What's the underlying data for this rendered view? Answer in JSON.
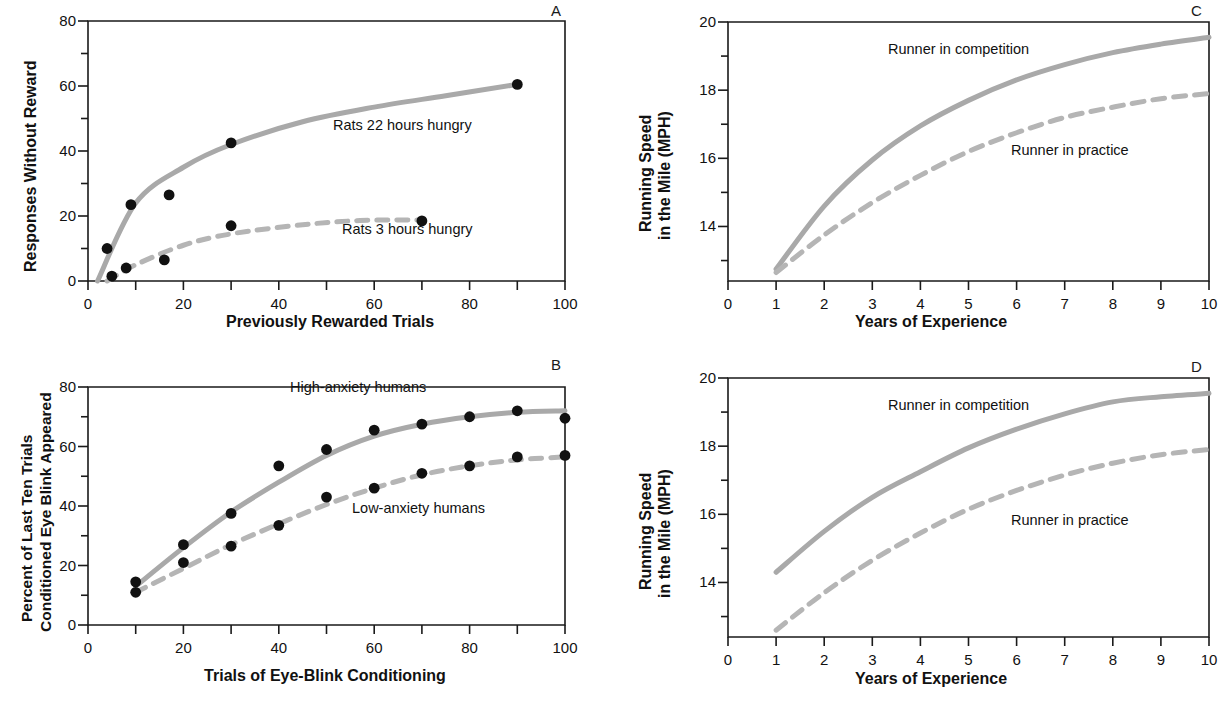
{
  "figure": {
    "panels": [
      "A",
      "B",
      "C",
      "D"
    ],
    "curve_color": "#a9a9a9",
    "point_color": "#111111",
    "axis_color": "#1a1a1a"
  },
  "panelA": {
    "letter": "A",
    "xlabel": "Previously Rewarded Trials",
    "ylabel": "Responses Without Reward",
    "xticks": [
      "0",
      "20",
      "40",
      "60",
      "80",
      "100"
    ],
    "yticks": [
      "0",
      "20",
      "40",
      "60",
      "80"
    ],
    "label_solid": "Rats 22 hours hungry",
    "label_dashed": "Rats 3 hours hungry"
  },
  "panelB": {
    "letter": "B",
    "xlabel": "Trials of Eye-Blink Conditioning",
    "ylabel_line1": "Percent of Last Ten Trials",
    "ylabel_line2": "Conditioned Eye Blink Appeared",
    "xticks": [
      "0",
      "20",
      "40",
      "60",
      "80",
      "100"
    ],
    "yticks": [
      "0",
      "20",
      "40",
      "60",
      "80"
    ],
    "label_solid": "High-anxiety humans",
    "label_dashed": "Low-anxiety humans"
  },
  "panelC": {
    "letter": "C",
    "xlabel": "Years of Experience",
    "ylabel_line1": "Running Speed",
    "ylabel_line2": "in the Mile (MPH)",
    "xticks": [
      "0",
      "1",
      "2",
      "3",
      "4",
      "5",
      "6",
      "7",
      "8",
      "9",
      "10"
    ],
    "yticks": [
      "14",
      "16",
      "18",
      "20"
    ],
    "label_solid": "Runner in competition",
    "label_dashed": "Runner in practice"
  },
  "panelD": {
    "letter": "D",
    "xlabel": "Years of Experience",
    "ylabel_line1": "Running Speed",
    "ylabel_line2": "in the Mile (MPH)",
    "xticks": [
      "0",
      "1",
      "2",
      "3",
      "4",
      "5",
      "6",
      "7",
      "8",
      "9",
      "10"
    ],
    "yticks": [
      "14",
      "16",
      "18",
      "20"
    ],
    "label_solid": "Runner in competition",
    "label_dashed": "Runner in practice"
  },
  "chart_data": [
    {
      "panel": "A",
      "type": "scatter",
      "title": "",
      "xlabel": "Previously Rewarded Trials",
      "ylabel": "Responses Without Reward",
      "xlim": [
        0,
        100
      ],
      "ylim": [
        0,
        80
      ],
      "grid": false,
      "legend": "inline-annotation",
      "series": [
        {
          "name": "Rats 22 hours hungry",
          "style": "solid",
          "color": "#a9a9a9",
          "points": [
            {
              "x": 4,
              "y": 10
            },
            {
              "x": 9,
              "y": 23.5
            },
            {
              "x": 17,
              "y": 26.5
            },
            {
              "x": 30,
              "y": 42.5
            },
            {
              "x": 90,
              "y": 60.5
            }
          ],
          "fit_curve": [
            {
              "x": 2,
              "y": 0
            },
            {
              "x": 10,
              "y": 24
            },
            {
              "x": 20,
              "y": 35
            },
            {
              "x": 30,
              "y": 42
            },
            {
              "x": 45,
              "y": 49
            },
            {
              "x": 60,
              "y": 53.5
            },
            {
              "x": 75,
              "y": 57
            },
            {
              "x": 90,
              "y": 60.5
            }
          ]
        },
        {
          "name": "Rats 3 hours hungry",
          "style": "dashed",
          "color": "#b5b5b5",
          "points": [
            {
              "x": 5,
              "y": 1.5
            },
            {
              "x": 8,
              "y": 4
            },
            {
              "x": 16,
              "y": 6.5
            },
            {
              "x": 30,
              "y": 17
            },
            {
              "x": 70,
              "y": 18.5
            }
          ],
          "fit_curve": [
            {
              "x": 4,
              "y": 0
            },
            {
              "x": 10,
              "y": 5
            },
            {
              "x": 20,
              "y": 11
            },
            {
              "x": 30,
              "y": 14.5
            },
            {
              "x": 45,
              "y": 17.3
            },
            {
              "x": 57,
              "y": 18.6
            },
            {
              "x": 70,
              "y": 18.8
            }
          ]
        }
      ]
    },
    {
      "panel": "B",
      "type": "scatter",
      "title": "",
      "xlabel": "Trials of Eye-Blink Conditioning",
      "ylabel": "Percent of Last Ten Trials Conditioned Eye Blink Appeared",
      "xlim": [
        0,
        100
      ],
      "ylim": [
        0,
        80
      ],
      "grid": false,
      "legend": "inline-annotation",
      "series": [
        {
          "name": "High-anxiety humans",
          "style": "solid",
          "color": "#a9a9a9",
          "points": [
            {
              "x": 10,
              "y": 14.5
            },
            {
              "x": 20,
              "y": 27
            },
            {
              "x": 30,
              "y": 37.5
            },
            {
              "x": 40,
              "y": 53.5
            },
            {
              "x": 50,
              "y": 59
            },
            {
              "x": 60,
              "y": 65.5
            },
            {
              "x": 70,
              "y": 67.5
            },
            {
              "x": 80,
              "y": 70
            },
            {
              "x": 90,
              "y": 72
            },
            {
              "x": 100,
              "y": 69.5
            }
          ],
          "fit_curve": [
            {
              "x": 10,
              "y": 13
            },
            {
              "x": 20,
              "y": 26
            },
            {
              "x": 30,
              "y": 38
            },
            {
              "x": 40,
              "y": 48
            },
            {
              "x": 50,
              "y": 57
            },
            {
              "x": 60,
              "y": 63.5
            },
            {
              "x": 70,
              "y": 67.5
            },
            {
              "x": 80,
              "y": 70
            },
            {
              "x": 90,
              "y": 71.5
            },
            {
              "x": 100,
              "y": 72
            }
          ]
        },
        {
          "name": "Low-anxiety humans",
          "style": "dashed",
          "color": "#b5b5b5",
          "points": [
            {
              "x": 10,
              "y": 11
            },
            {
              "x": 20,
              "y": 21
            },
            {
              "x": 30,
              "y": 26.5
            },
            {
              "x": 40,
              "y": 33.5
            },
            {
              "x": 50,
              "y": 43
            },
            {
              "x": 60,
              "y": 46
            },
            {
              "x": 70,
              "y": 51
            },
            {
              "x": 80,
              "y": 53.5
            },
            {
              "x": 90,
              "y": 56.5
            },
            {
              "x": 100,
              "y": 57
            }
          ],
          "fit_curve": [
            {
              "x": 10,
              "y": 11
            },
            {
              "x": 20,
              "y": 19
            },
            {
              "x": 30,
              "y": 27
            },
            {
              "x": 40,
              "y": 34
            },
            {
              "x": 50,
              "y": 40.5
            },
            {
              "x": 60,
              "y": 46
            },
            {
              "x": 70,
              "y": 50.5
            },
            {
              "x": 80,
              "y": 53.5
            },
            {
              "x": 90,
              "y": 55.5
            },
            {
              "x": 100,
              "y": 56.5
            }
          ]
        }
      ]
    },
    {
      "panel": "C",
      "type": "line",
      "title": "",
      "xlabel": "Years of Experience",
      "ylabel": "Running Speed in the Mile (MPH)",
      "xlim": [
        0,
        10
      ],
      "ylim": [
        12.4,
        20
      ],
      "grid": false,
      "legend": "inline-annotation",
      "series": [
        {
          "name": "Runner in competition",
          "style": "solid",
          "color": "#a9a9a9",
          "x": [
            1,
            2,
            3,
            4,
            5,
            6,
            7,
            8,
            9,
            10
          ],
          "values": [
            12.75,
            14.6,
            15.95,
            16.95,
            17.7,
            18.3,
            18.75,
            19.1,
            19.35,
            19.55
          ]
        },
        {
          "name": "Runner in practice",
          "style": "dashed",
          "color": "#b5b5b5",
          "x": [
            1,
            2,
            3,
            4,
            5,
            6,
            7,
            8,
            9,
            10
          ],
          "values": [
            12.65,
            13.75,
            14.7,
            15.5,
            16.2,
            16.75,
            17.2,
            17.5,
            17.75,
            17.9
          ]
        }
      ]
    },
    {
      "panel": "D",
      "type": "line",
      "title": "",
      "xlabel": "Years of Experience",
      "ylabel": "Running Speed in the Mile (MPH)",
      "xlim": [
        0,
        10
      ],
      "ylim": [
        12.4,
        20
      ],
      "grid": false,
      "legend": "inline-annotation",
      "series": [
        {
          "name": "Runner in competition",
          "style": "solid",
          "color": "#a9a9a9",
          "x": [
            1,
            2,
            3,
            4,
            5,
            6,
            7,
            8,
            9,
            10
          ],
          "values": [
            14.3,
            15.5,
            16.5,
            17.25,
            17.95,
            18.5,
            18.95,
            19.3,
            19.45,
            19.55
          ]
        },
        {
          "name": "Runner in practice",
          "style": "dashed",
          "color": "#b5b5b5",
          "x": [
            1,
            2,
            3,
            4,
            5,
            6,
            7,
            8,
            9,
            10
          ],
          "values": [
            12.6,
            13.7,
            14.65,
            15.45,
            16.15,
            16.7,
            17.15,
            17.5,
            17.75,
            17.9
          ]
        }
      ]
    }
  ]
}
